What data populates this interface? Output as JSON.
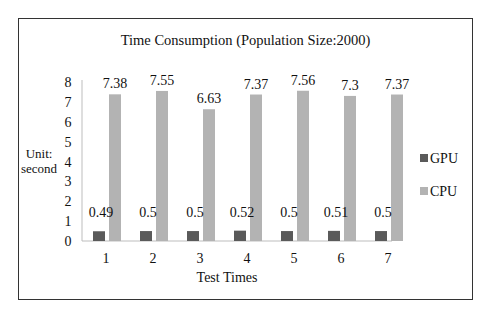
{
  "chart_data": {
    "type": "bar",
    "title": "Time Consumption (Population Size:2000)",
    "xlabel": "Test Times",
    "ylabel": "Unit: second",
    "ylabel_lines": [
      "Unit:",
      "second"
    ],
    "categories": [
      "1",
      "2",
      "3",
      "4",
      "5",
      "6",
      "7"
    ],
    "series": [
      {
        "name": "GPU",
        "color": "#5a5a5a",
        "values": [
          0.49,
          0.5,
          0.5,
          0.52,
          0.5,
          0.51,
          0.5
        ]
      },
      {
        "name": "CPU",
        "color": "#b3b3b3",
        "values": [
          7.38,
          7.55,
          6.63,
          7.37,
          7.56,
          7.3,
          7.37
        ]
      }
    ],
    "yticks": [
      "0",
      "1",
      "2",
      "3",
      "4",
      "5",
      "6",
      "7",
      "8"
    ],
    "ylim": [
      0,
      8
    ],
    "grid": false,
    "legend_position": "right",
    "data_labels": true
  }
}
